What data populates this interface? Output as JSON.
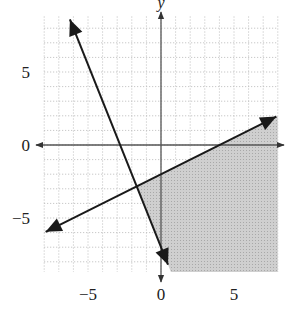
{
  "chart_data": {
    "type": "line",
    "title": "",
    "xlabel": "",
    "ylabel": "y",
    "xlim": [
      -8,
      8
    ],
    "ylim": [
      -8.7,
      8.8
    ],
    "grid": true,
    "grid_style": "dotted",
    "x_ticks": [
      {
        "value": -5,
        "label": "−5"
      },
      {
        "value": 0,
        "label": "0"
      },
      {
        "value": 5,
        "label": "5"
      }
    ],
    "y_ticks": [
      {
        "value": 5,
        "label": "5"
      },
      {
        "value": 0,
        "label": "0"
      },
      {
        "value": -5,
        "label": "−5"
      }
    ],
    "series": [
      {
        "name": "boundary-line-1",
        "equation": "y = x/2 - 2",
        "slope": 0.5,
        "intercept": -2,
        "x": [
          -7.9,
          7.9
        ],
        "y": [
          -5.95,
          1.95
        ],
        "style": "solid",
        "arrows": "both"
      },
      {
        "name": "boundary-line-2",
        "equation": "y = -5x/2 - 7",
        "slope": -2.5,
        "intercept": -7,
        "x": [
          -6.24,
          0.48
        ],
        "y": [
          8.6,
          -8.2
        ],
        "style": "solid",
        "arrows": "both"
      }
    ],
    "shaded_region": {
      "description": "y <= x/2 - 2 and y >= -5x/2 - 7",
      "polygon": [
        [
          -1.67,
          -2.83
        ],
        [
          8,
          2
        ],
        [
          8,
          -8.7
        ],
        [
          0.68,
          -8.7
        ]
      ],
      "color": "#c8c8c8"
    }
  },
  "colors": {
    "line": "#1a1a1a",
    "axis": "#555555",
    "grid": "#bbbbbb",
    "shade": "#c8c8c8"
  }
}
